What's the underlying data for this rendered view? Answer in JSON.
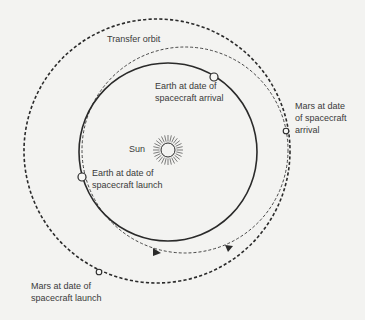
{
  "diagram": {
    "colors": {
      "background": "#f3f3f1",
      "ink": "#2a2a2a",
      "label": "#3a3a3a"
    },
    "bodies": {
      "sun": {
        "label": "Sun"
      }
    },
    "orbits": [
      {
        "id": "earth-orbit",
        "style": "solid"
      },
      {
        "id": "mars-orbit",
        "style": "dashed-heavy"
      },
      {
        "id": "transfer-orbit",
        "style": "dashed-light",
        "label": "Transfer orbit"
      }
    ],
    "markers": [
      {
        "id": "earth-launch",
        "label": "Earth at date of\nspacecraft launch"
      },
      {
        "id": "earth-arrival",
        "label": "Earth at date of\nspacecraft arrival"
      },
      {
        "id": "mars-launch",
        "label": "Mars at date of\nspacecraft launch"
      },
      {
        "id": "mars-arrival",
        "label": "Mars at date\nof spacecraft\narrival"
      }
    ],
    "direction_arrows": 2
  }
}
